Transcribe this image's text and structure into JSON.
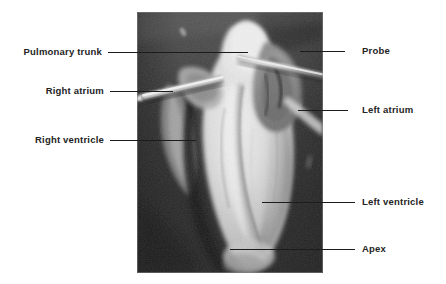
{
  "figure": {
    "image": {
      "name": "heart-dissection-photograph",
      "description": "Grayscale photograph of a dissected heart specimen with a metal probe passed through the pulmonary trunk",
      "colors": {
        "background_dark": "#2e2e2e",
        "background_mid": "#555555",
        "specimen_pale": "#e8e4da",
        "probe_metal": "#cfcfcf",
        "border": "#777777"
      }
    },
    "labels": {
      "left": [
        {
          "id": "pulmonary-trunk",
          "text": "Pulmonary trunk"
        },
        {
          "id": "right-atrium",
          "text": "Right atrium"
        },
        {
          "id": "right-ventricle",
          "text": "Right ventricle"
        }
      ],
      "right": [
        {
          "id": "probe",
          "text": "Probe"
        },
        {
          "id": "left-atrium",
          "text": "Left atrium"
        },
        {
          "id": "left-ventricle",
          "text": "Left ventricle"
        },
        {
          "id": "apex",
          "text": "Apex"
        }
      ]
    }
  }
}
